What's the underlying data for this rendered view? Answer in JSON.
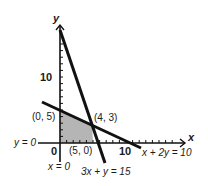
{
  "diagram": {
    "type": "linear-programming-feasible-region",
    "axes": {
      "x_label": "x",
      "y_label": "y",
      "origin_label": "0",
      "x_tick_label": "10",
      "y_tick_label": "10",
      "x_axis_equation": "y = 0",
      "y_axis_equation": "x = 0"
    },
    "lines": [
      {
        "equation": "x + 2y = 10"
      },
      {
        "equation": "3x + y = 15"
      }
    ],
    "points": [
      {
        "label": "(0, 5)"
      },
      {
        "label": "(4, 3)"
      },
      {
        "label": "(5, 0)"
      }
    ],
    "colors": {
      "line": "#111111",
      "region": "#b5b5b5"
    }
  }
}
